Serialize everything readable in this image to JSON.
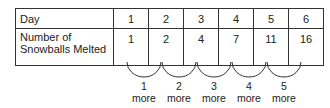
{
  "table": {
    "row_header_1": "Day",
    "row_header_2_line1": "Number of",
    "row_header_2_line2": "Snowballs Melted",
    "days": [
      "1",
      "2",
      "3",
      "4",
      "5",
      "6"
    ],
    "snowballs": [
      "1",
      "2",
      "4",
      "7",
      "11",
      "16"
    ]
  },
  "differences": [
    {
      "amount": "1",
      "word": "more"
    },
    {
      "amount": "2",
      "word": "more"
    },
    {
      "amount": "3",
      "word": "more"
    },
    {
      "amount": "4",
      "word": "more"
    },
    {
      "amount": "5",
      "word": "more"
    }
  ]
}
